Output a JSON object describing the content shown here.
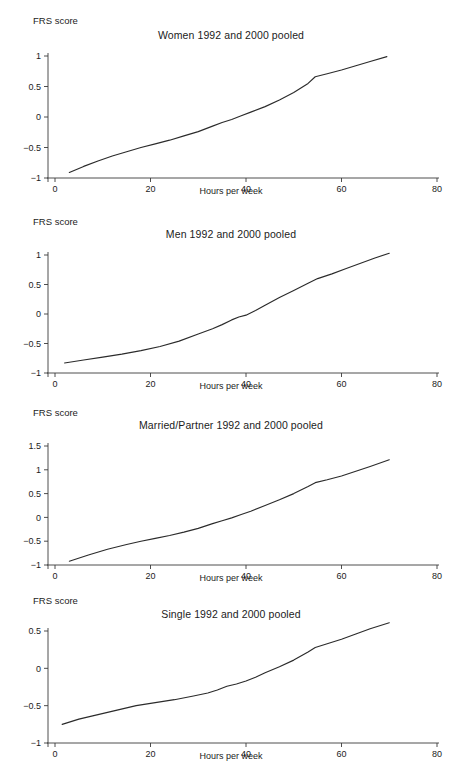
{
  "figure": {
    "background": "#ffffff",
    "line_color": "#2b2b2b",
    "axis_color": "#3a3a3a",
    "width": 462,
    "height": 764
  },
  "chart_data": [
    {
      "type": "line",
      "title": "Women 1992 and 2000 pooled",
      "xlabel": "Hours per week",
      "ylabel": "FRS score",
      "xlim": [
        0,
        80
      ],
      "ylim": [
        -1,
        1
      ],
      "xticks": [
        0,
        20,
        40,
        60,
        80
      ],
      "xticklabels": [
        "0",
        "20",
        "40",
        "60",
        "80"
      ],
      "yticks": [
        -1,
        -0.5,
        0,
        0.5,
        1
      ],
      "yticklabels": [
        "-1",
        "-0.5",
        "0",
        "0.5",
        "1"
      ],
      "grid": false,
      "legend": "none",
      "series": [
        {
          "name": "Women",
          "x": [
            3,
            6,
            9,
            12,
            15,
            18,
            21,
            24,
            27,
            30,
            33,
            35,
            37,
            39,
            41,
            44,
            47,
            50,
            53,
            54.5,
            57,
            60,
            63,
            66,
            69.5
          ],
          "y": [
            -0.91,
            -0.81,
            -0.72,
            -0.64,
            -0.57,
            -0.5,
            -0.44,
            -0.38,
            -0.31,
            -0.24,
            -0.15,
            -0.09,
            -0.04,
            0.02,
            0.08,
            0.17,
            0.28,
            0.4,
            0.55,
            0.66,
            0.71,
            0.77,
            0.84,
            0.91,
            0.99
          ]
        }
      ]
    },
    {
      "type": "line",
      "title": "Men 1992 and 2000 pooled",
      "xlabel": "Hours per week",
      "ylabel": "FRS score",
      "xlim": [
        0,
        80
      ],
      "ylim": [
        -1,
        1
      ],
      "xticks": [
        0,
        20,
        40,
        60,
        80
      ],
      "xticklabels": [
        "0",
        "20",
        "40",
        "60",
        "80"
      ],
      "yticks": [
        -1,
        -0.5,
        0,
        0.5,
        1
      ],
      "yticklabels": [
        "-1",
        "-0.5",
        "0",
        "0.5",
        "1"
      ],
      "grid": false,
      "legend": "none",
      "series": [
        {
          "name": "Men",
          "x": [
            2,
            6,
            10,
            14,
            18,
            22,
            26,
            30,
            33,
            35,
            37,
            38.5,
            40,
            42,
            44,
            47,
            50,
            53,
            55,
            58,
            61,
            64,
            67,
            70
          ],
          "y": [
            -0.83,
            -0.78,
            -0.73,
            -0.68,
            -0.62,
            -0.55,
            -0.46,
            -0.34,
            -0.25,
            -0.18,
            -0.1,
            -0.05,
            -0.02,
            0.06,
            0.15,
            0.28,
            0.4,
            0.52,
            0.6,
            0.68,
            0.77,
            0.86,
            0.95,
            1.03
          ]
        }
      ]
    },
    {
      "type": "line",
      "title": "Married/Partner 1992 and 2000 pooled",
      "xlabel": "Hours per week",
      "ylabel": "FRS score",
      "xlim": [
        0,
        80
      ],
      "ylim": [
        -1,
        1.5
      ],
      "xticks": [
        0,
        20,
        40,
        60,
        80
      ],
      "xticklabels": [
        "0",
        "20",
        "40",
        "60",
        "80"
      ],
      "yticks": [
        -1,
        -0.5,
        0,
        0.5,
        1,
        1.5
      ],
      "yticklabels": [
        "-1",
        "-0.5",
        "0",
        "0.5",
        "1",
        "1.5"
      ],
      "grid": false,
      "legend": "none",
      "series": [
        {
          "name": "Married/Partner",
          "x": [
            3,
            7,
            11,
            15,
            18,
            21,
            24,
            27,
            30,
            33,
            35,
            37,
            39,
            41,
            44,
            47,
            50,
            53,
            54.5,
            57,
            60,
            63,
            66,
            70
          ],
          "y": [
            -0.92,
            -0.79,
            -0.67,
            -0.57,
            -0.5,
            -0.44,
            -0.38,
            -0.31,
            -0.23,
            -0.13,
            -0.07,
            -0.01,
            0.06,
            0.13,
            0.25,
            0.37,
            0.5,
            0.65,
            0.73,
            0.79,
            0.87,
            0.97,
            1.07,
            1.21
          ]
        }
      ]
    },
    {
      "type": "line",
      "title": "Single 1992 and 2000 pooled",
      "xlabel": "Hours per week",
      "ylabel": "FRS score",
      "xlim": [
        0,
        80
      ],
      "ylim": [
        -1,
        0.5
      ],
      "xticks": [
        0,
        20,
        40,
        60,
        80
      ],
      "xticklabels": [
        "0",
        "20",
        "40",
        "60",
        "80"
      ],
      "yticks": [
        -1,
        -0.5,
        0,
        0.5
      ],
      "yticklabels": [
        "-1",
        "-0.5",
        "0",
        "0.5"
      ],
      "grid": false,
      "legend": "none",
      "series": [
        {
          "name": "Single",
          "x": [
            1.5,
            5,
            9,
            13,
            17,
            21,
            25,
            29,
            32,
            34,
            36,
            38,
            40,
            42,
            44,
            47,
            50,
            53,
            54.5,
            57,
            60,
            63,
            66,
            70
          ],
          "y": [
            -0.75,
            -0.68,
            -0.62,
            -0.56,
            -0.5,
            -0.46,
            -0.42,
            -0.37,
            -0.33,
            -0.29,
            -0.24,
            -0.21,
            -0.17,
            -0.12,
            -0.06,
            0.02,
            0.11,
            0.22,
            0.28,
            0.33,
            0.39,
            0.46,
            0.53,
            0.61
          ]
        }
      ]
    }
  ]
}
